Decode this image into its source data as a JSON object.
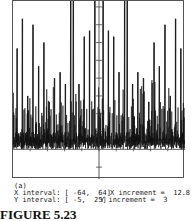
{
  "chart_data": {
    "type": "line",
    "title": "",
    "xlabel": "",
    "ylabel": "",
    "xlim": [
      -64,
      64
    ],
    "ylim": [
      -5,
      25
    ],
    "x_increment": 12.8,
    "y_increment": 3,
    "grid": false,
    "peaks": [
      {
        "x": -61,
        "y": 17
      },
      {
        "x": -57,
        "y": 22
      },
      {
        "x": -53,
        "y": 9
      },
      {
        "x": -49,
        "y": 21
      },
      {
        "x": -45,
        "y": 14
      },
      {
        "x": -41,
        "y": 18
      },
      {
        "x": -37,
        "y": 8
      },
      {
        "x": -33,
        "y": 12
      },
      {
        "x": -29,
        "y": 13
      },
      {
        "x": -25,
        "y": 11
      },
      {
        "x": -21,
        "y": 26
      },
      {
        "x": -19,
        "y": 28
      },
      {
        "x": -15,
        "y": 11
      },
      {
        "x": -11,
        "y": 19
      },
      {
        "x": -7,
        "y": 20
      },
      {
        "x": -3,
        "y": 26
      },
      {
        "x": 3,
        "y": 26
      },
      {
        "x": 7,
        "y": 20
      },
      {
        "x": 11,
        "y": 19
      },
      {
        "x": 15,
        "y": 13
      },
      {
        "x": 19,
        "y": 28
      },
      {
        "x": 21,
        "y": 26
      },
      {
        "x": 25,
        "y": 11
      },
      {
        "x": 29,
        "y": 13
      },
      {
        "x": 33,
        "y": 12
      },
      {
        "x": 37,
        "y": 8
      },
      {
        "x": 41,
        "y": 18
      },
      {
        "x": 45,
        "y": 14
      },
      {
        "x": 49,
        "y": 21
      },
      {
        "x": 53,
        "y": 9
      },
      {
        "x": 57,
        "y": 22
      },
      {
        "x": 61,
        "y": 17
      }
    ]
  },
  "caption": {
    "part": "(a)",
    "x_interval_label": "X interval: [ -64,  64]",
    "y_interval_label": "Y interval: [ -5,  25]",
    "x_increment_label": "X increment =  12.8",
    "y_increment_label": "Y increment =  3"
  },
  "figure_label": "FIGURE 5.23"
}
